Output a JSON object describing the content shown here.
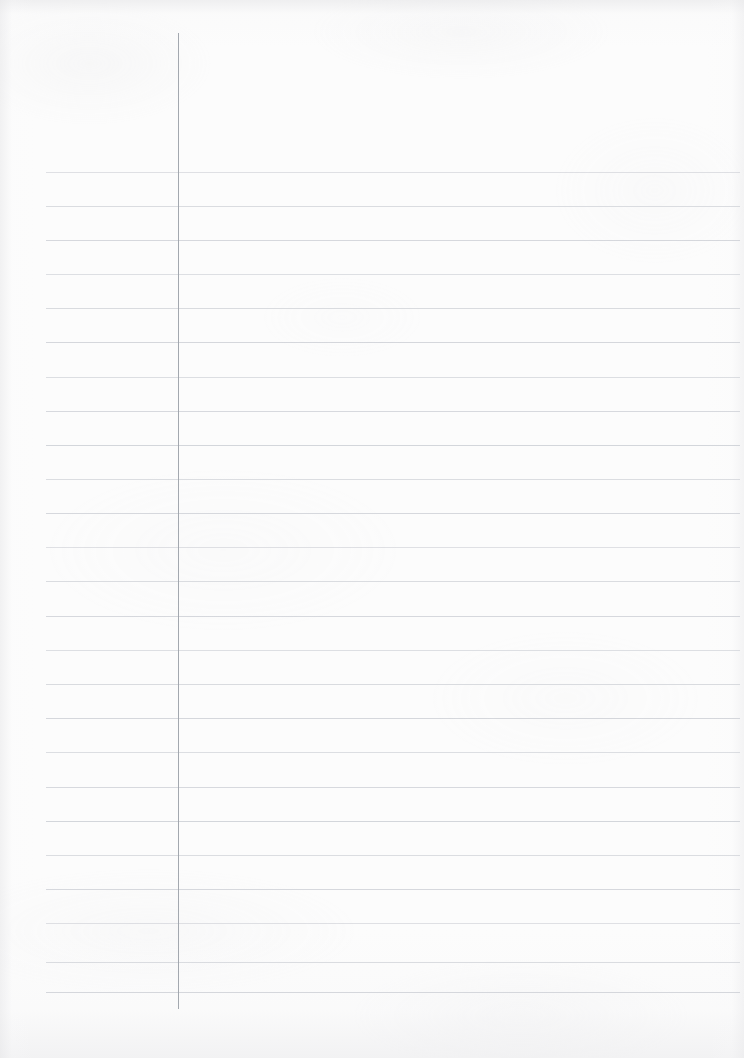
{
  "document": {
    "type": "lined-notebook-paper",
    "title": "Blank ruled notebook page",
    "orientation": "portrait",
    "page_width": 744,
    "page_height": 1058,
    "content_text": "",
    "is_blank": true
  },
  "paper": {
    "background_color": "#fcfcfc",
    "edge_shadow_color": "#e6e6e8",
    "grain_color": "#d4d4d8"
  },
  "ruling": {
    "style": "college-ruled",
    "rule_color": "#c9ccd2",
    "rule_thickness": 1,
    "rule_left_x": 46,
    "rule_right_x": 740,
    "first_rule_y": 172,
    "rule_spacing": 34.2,
    "rule_count": 25,
    "rule_y_positions": [
      172,
      206,
      240,
      274,
      308,
      342,
      377,
      411,
      445,
      479,
      513,
      547,
      581,
      616,
      650,
      684,
      718,
      752,
      787,
      821,
      855,
      889,
      923,
      962,
      992
    ]
  },
  "margin_rule": {
    "label": "vertical-margin-line",
    "color": "#9ea3ab",
    "thickness": 1,
    "x": 178,
    "top_y": 33,
    "bottom_y": 1009
  },
  "writing_area": {
    "left": 180,
    "top": 172,
    "right": 740,
    "bottom": 1009,
    "placeholder": ""
  }
}
